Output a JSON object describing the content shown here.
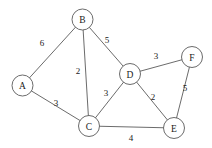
{
  "figure": {
    "type": "undirected-weighted-graph",
    "background_color": "#ffffff",
    "stroke_color": "#5a5a5a",
    "text_color": "#1a1a1a",
    "node_radius": 10.5
  },
  "nodes": [
    {
      "id": "A",
      "label": "A",
      "x": 22.5,
      "y": 85.5
    },
    {
      "id": "B",
      "label": "B",
      "x": 82.5,
      "y": 19.5
    },
    {
      "id": "C",
      "label": "C",
      "x": 89.0,
      "y": 126.0
    },
    {
      "id": "D",
      "label": "D",
      "x": 130.0,
      "y": 74.0
    },
    {
      "id": "E",
      "label": "E",
      "x": 174.0,
      "y": 128.0
    },
    {
      "id": "F",
      "label": "F",
      "x": 192.0,
      "y": 57.0
    }
  ],
  "edges": [
    {
      "from": "A",
      "to": "B",
      "weight": "6",
      "label_x": 42,
      "label_y": 43
    },
    {
      "from": "A",
      "to": "C",
      "weight": "3",
      "label_x": 56,
      "label_y": 103
    },
    {
      "from": "B",
      "to": "C",
      "weight": "2",
      "label_x": 78,
      "label_y": 71
    },
    {
      "from": "B",
      "to": "D",
      "weight": "5",
      "label_x": 107,
      "label_y": 40
    },
    {
      "from": "C",
      "to": "D",
      "weight": "3",
      "label_x": 106,
      "label_y": 93
    },
    {
      "from": "C",
      "to": "E",
      "weight": "4",
      "label_x": 131,
      "label_y": 138
    },
    {
      "from": "D",
      "to": "E",
      "weight": "2",
      "label_x": 153,
      "label_y": 97
    },
    {
      "from": "D",
      "to": "F",
      "weight": "3",
      "label_x": 156,
      "label_y": 56
    },
    {
      "from": "E",
      "to": "F",
      "weight": "5",
      "label_x": 185,
      "label_y": 88
    }
  ],
  "chart_data": {
    "type": "graph",
    "title": "",
    "directed": false,
    "weighted": true,
    "node_ids": [
      "A",
      "B",
      "C",
      "D",
      "E",
      "F"
    ],
    "edge_list": [
      [
        "A",
        "B",
        6
      ],
      [
        "A",
        "C",
        3
      ],
      [
        "B",
        "C",
        2
      ],
      [
        "B",
        "D",
        5
      ],
      [
        "C",
        "D",
        3
      ],
      [
        "C",
        "E",
        4
      ],
      [
        "D",
        "E",
        2
      ],
      [
        "D",
        "F",
        3
      ],
      [
        "E",
        "F",
        5
      ]
    ],
    "adjacency": {
      "A": {
        "B": 6,
        "C": 3
      },
      "B": {
        "A": 6,
        "C": 2,
        "D": 5
      },
      "C": {
        "A": 3,
        "B": 2,
        "D": 3,
        "E": 4
      },
      "D": {
        "B": 5,
        "C": 3,
        "E": 2,
        "F": 3
      },
      "E": {
        "C": 4,
        "D": 2,
        "F": 5
      },
      "F": {
        "D": 3,
        "E": 5
      }
    },
    "node_count": 6,
    "edge_count": 9,
    "legend": [],
    "xlabel": "",
    "ylabel": ""
  }
}
